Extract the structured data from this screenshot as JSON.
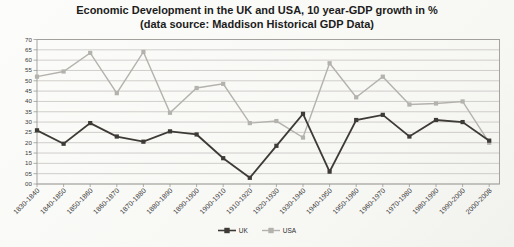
{
  "title": {
    "line1": "Economic Development in the UK and USA, 10 year-GDP growth in %",
    "line2": "(data source: Maddison Historical GDP Data)"
  },
  "chart_data": {
    "type": "line",
    "categories": [
      "1830-1840",
      "1840-1850",
      "1850-1860",
      "1860-1870",
      "1870-1880",
      "1880-1890",
      "1890-1900",
      "1900-1910",
      "1910-1920",
      "1920-1930",
      "1930-1940",
      "1940-1950",
      "1950-1960",
      "1960-1970",
      "1970-1980",
      "1980-1990",
      "1990-2000",
      "2000-2008"
    ],
    "series": [
      {
        "name": "UK",
        "color": "#3e3b37",
        "marker": "square",
        "values": [
          26,
          19.5,
          29.5,
          23,
          20.5,
          25.5,
          24,
          12.5,
          3,
          18.5,
          34,
          6,
          31,
          33.5,
          23,
          31,
          30,
          21
        ]
      },
      {
        "name": "USA",
        "color": "#b4b2ad",
        "marker": "square",
        "values": [
          52,
          54.5,
          63.5,
          44,
          64,
          34.5,
          46.5,
          48.5,
          29.5,
          30.5,
          22.5,
          58.5,
          42,
          52,
          38.5,
          39,
          40,
          20
        ]
      }
    ],
    "xlabel": "",
    "ylabel": "",
    "ylim": [
      0,
      70
    ],
    "ytick_step": 5,
    "ytick_labels": [
      "00",
      "05",
      "10",
      "15",
      "20",
      "25",
      "30",
      "35",
      "40",
      "45",
      "50",
      "55",
      "60",
      "65",
      "70"
    ],
    "grid": "horizontal",
    "legend_position": "bottom-center"
  },
  "colors": {
    "grid": "#c4c3c0",
    "axis": "#9c9b98",
    "tick_text": "#3a3a3a",
    "title_text": "#1c1c1c"
  }
}
